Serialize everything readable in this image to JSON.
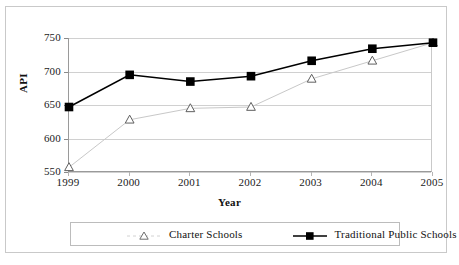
{
  "chart_data": {
    "type": "line",
    "title": "",
    "xlabel": "Year",
    "ylabel": "API",
    "categories": [
      "1999",
      "2000",
      "2001",
      "2002",
      "2003",
      "2004",
      "2005"
    ],
    "x": [
      1999,
      2000,
      2001,
      2002,
      2003,
      2004,
      2005
    ],
    "series": [
      {
        "name": "Charter Schools",
        "marker": "open-triangle",
        "color": "#c8c8c8",
        "values": [
          557,
          628,
          645,
          647,
          689,
          716,
          743
        ]
      },
      {
        "name": "Traditional Public Schools",
        "marker": "filled-square",
        "color": "#000000",
        "values": [
          647,
          695,
          685,
          693,
          716,
          734,
          743
        ]
      }
    ],
    "ylim": [
      550,
      750
    ],
    "yticks": [
      550,
      600,
      650,
      700,
      750
    ],
    "ytick_labels": [
      "550",
      "600",
      "650",
      "700",
      "750"
    ],
    "grid": "horizontal",
    "legend_position": "bottom"
  },
  "axes": {
    "y_title": "API",
    "x_title": "Year",
    "y_tick_labels": [
      "750",
      "700",
      "650",
      "600",
      "550"
    ],
    "x_tick_labels": [
      "1999",
      "2000",
      "2001",
      "2002",
      "2003",
      "2004",
      "2005"
    ]
  },
  "legend": {
    "entries": [
      {
        "label": "Charter Schools",
        "marker": "open-triangle",
        "color": "#c8c8c8"
      },
      {
        "label": "Traditional Public Schools",
        "marker": "filled-square",
        "color": "#000000"
      }
    ]
  }
}
